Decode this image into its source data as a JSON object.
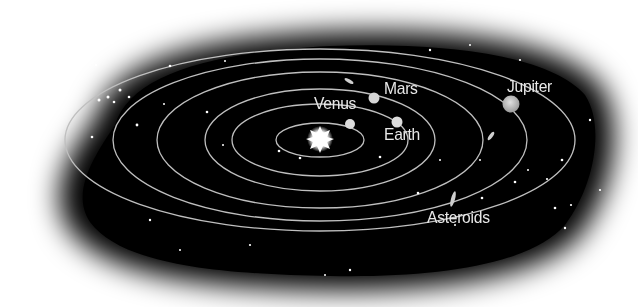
{
  "diagram": {
    "labels": {
      "venus": "Venus",
      "mars": "Mars",
      "earth": "Earth",
      "jupiter": "Jupiter",
      "asteroids": "Asteroids"
    },
    "colors": {
      "space": "#000000",
      "orbit": "#bfbfbf",
      "text": "#e8e8e8",
      "background": "#ffffff"
    }
  }
}
